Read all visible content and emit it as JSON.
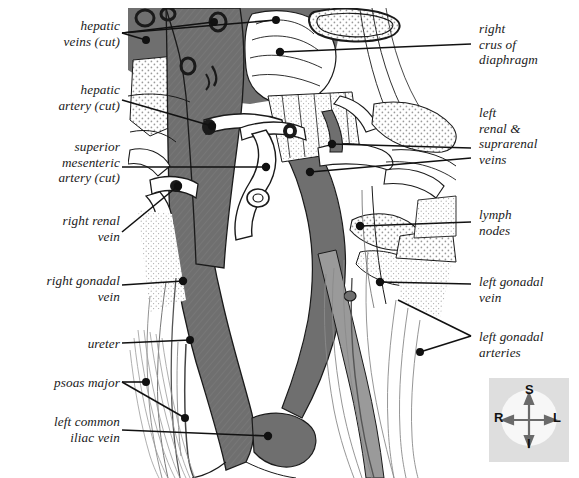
{
  "figure": {
    "kind": "anatomical-illustration",
    "background_color": "#ffffff",
    "ink_color": "#1a1a1a",
    "vein_fill_color": "#6f6f6f",
    "artery_fill_color": "#ffffff",
    "stipple_color": "#8c8c8c"
  },
  "labels_left": [
    {
      "id": "hepatic-veins-cut",
      "text": "hepatic\nveins (cut)",
      "x": 2,
      "y": 18,
      "w": 118
    },
    {
      "id": "hepatic-artery-cut",
      "text": "hepatic\nartery (cut)",
      "x": 2,
      "y": 82,
      "w": 118
    },
    {
      "id": "superior-mesenteric-artery-cut",
      "text": "superior\nmesenteric\nartery (cut)",
      "x": 2,
      "y": 139,
      "w": 118
    },
    {
      "id": "right-renal-vein",
      "text": "right renal\nvein",
      "x": 2,
      "y": 213,
      "w": 118
    },
    {
      "id": "right-gonadal-vein",
      "text": "right gonadal\nvein",
      "x": 2,
      "y": 273,
      "w": 118
    },
    {
      "id": "ureter",
      "text": "ureter",
      "x": 2,
      "y": 336,
      "w": 118
    },
    {
      "id": "psoas-major",
      "text": "psoas major",
      "x": 2,
      "y": 375,
      "w": 118
    },
    {
      "id": "left-common-iliac-vein",
      "text": "left common\niliac vein",
      "x": 2,
      "y": 414,
      "w": 118
    }
  ],
  "labels_right": [
    {
      "id": "right-crus-of-diaphragm",
      "text": "right\ncrus of\ndiaphragm",
      "x": 479,
      "y": 21,
      "w": 98
    },
    {
      "id": "left-renal-suprarenal-veins",
      "text": "left\nrenal &\nsuprarenal\nveins",
      "x": 479,
      "y": 105,
      "w": 98
    },
    {
      "id": "lymph-nodes",
      "text": "lymph\nnodes",
      "x": 479,
      "y": 207,
      "w": 98
    },
    {
      "id": "left-gonadal-vein",
      "text": "left gonadal\nvein",
      "x": 479,
      "y": 274,
      "w": 98
    },
    {
      "id": "left-gonadal-arteries",
      "text": "left gonadal\narteries",
      "x": 479,
      "y": 329,
      "w": 98
    }
  ],
  "compass": {
    "superior": "S",
    "inferior": "I",
    "right": "R",
    "left": "L",
    "box_color": "#dedede",
    "disc_color": "#f7f7f7"
  }
}
